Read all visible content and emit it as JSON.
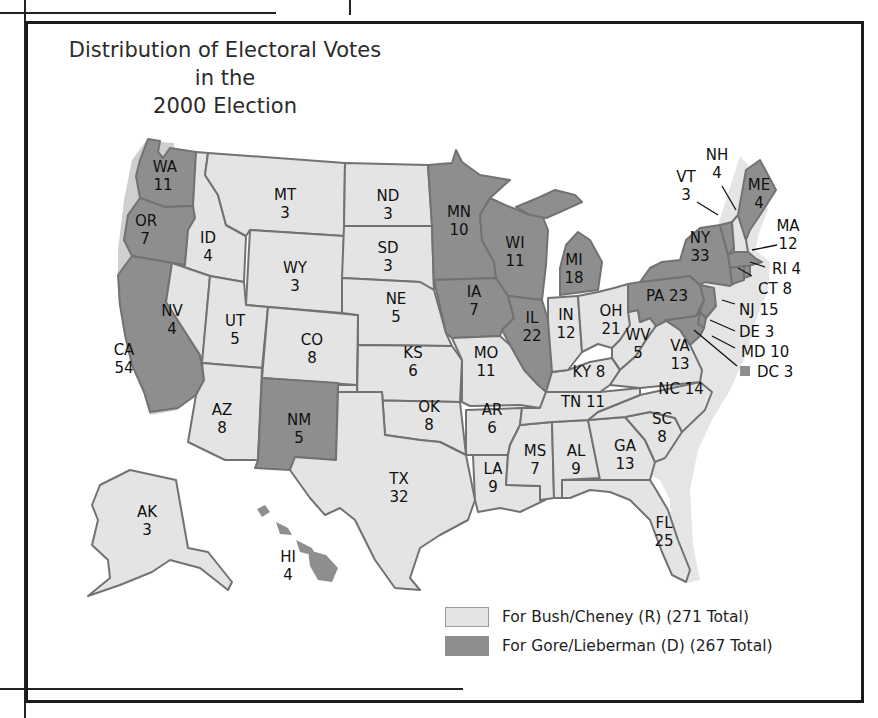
{
  "title": {
    "line1": "Distribution of Electoral Votes in the",
    "line2": "2000 Election"
  },
  "colors": {
    "bush_fill": "#e4e4e4",
    "gore_fill": "#8e8e8e",
    "border": "#727272",
    "frame": "#1b1b1b"
  },
  "legend": [
    {
      "party": "R",
      "label": "For Bush/Cheney (R) (271 Total)",
      "color": "#e4e4e4"
    },
    {
      "party": "D",
      "label": "For Gore/Lieberman (D) (267 Total)",
      "color": "#8e8e8e"
    }
  ],
  "states": {
    "WA": {
      "abbr": "WA",
      "votes": "11",
      "winner": "D"
    },
    "OR": {
      "abbr": "OR",
      "votes": "7",
      "winner": "D"
    },
    "CA": {
      "abbr": "CA",
      "votes": "54",
      "winner": "D"
    },
    "ID": {
      "abbr": "ID",
      "votes": "4",
      "winner": "R"
    },
    "NV": {
      "abbr": "NV",
      "votes": "4",
      "winner": "R"
    },
    "MT": {
      "abbr": "MT",
      "votes": "3",
      "winner": "R"
    },
    "WY": {
      "abbr": "WY",
      "votes": "3",
      "winner": "R"
    },
    "UT": {
      "abbr": "UT",
      "votes": "5",
      "winner": "R"
    },
    "CO": {
      "abbr": "CO",
      "votes": "8",
      "winner": "R"
    },
    "AZ": {
      "abbr": "AZ",
      "votes": "8",
      "winner": "R"
    },
    "NM": {
      "abbr": "NM",
      "votes": "5",
      "winner": "D"
    },
    "ND": {
      "abbr": "ND",
      "votes": "3",
      "winner": "R"
    },
    "SD": {
      "abbr": "SD",
      "votes": "3",
      "winner": "R"
    },
    "NE": {
      "abbr": "NE",
      "votes": "5",
      "winner": "R"
    },
    "KS": {
      "abbr": "KS",
      "votes": "6",
      "winner": "R"
    },
    "OK": {
      "abbr": "OK",
      "votes": "8",
      "winner": "R"
    },
    "TX": {
      "abbr": "TX",
      "votes": "32",
      "winner": "R"
    },
    "MN": {
      "abbr": "MN",
      "votes": "10",
      "winner": "D"
    },
    "IA": {
      "abbr": "IA",
      "votes": "7",
      "winner": "D"
    },
    "MO": {
      "abbr": "MO",
      "votes": "11",
      "winner": "R"
    },
    "AR": {
      "abbr": "AR",
      "votes": "6",
      "winner": "R"
    },
    "LA": {
      "abbr": "LA",
      "votes": "9",
      "winner": "R"
    },
    "WI": {
      "abbr": "WI",
      "votes": "11",
      "winner": "D"
    },
    "IL": {
      "abbr": "IL",
      "votes": "22",
      "winner": "D"
    },
    "MI": {
      "abbr": "MI",
      "votes": "18",
      "winner": "D"
    },
    "IN": {
      "abbr": "IN",
      "votes": "12",
      "winner": "R"
    },
    "OH": {
      "abbr": "OH",
      "votes": "21",
      "winner": "R"
    },
    "KY": {
      "abbr": "KY",
      "votes": "8",
      "winner": "R",
      "label": "KY 8"
    },
    "TN": {
      "abbr": "TN",
      "votes": "11",
      "winner": "R",
      "label": "TN 11"
    },
    "MS": {
      "abbr": "MS",
      "votes": "7",
      "winner": "R"
    },
    "AL": {
      "abbr": "AL",
      "votes": "9",
      "winner": "R"
    },
    "GA": {
      "abbr": "GA",
      "votes": "13",
      "winner": "R"
    },
    "FL": {
      "abbr": "FL",
      "votes": "25",
      "winner": "R"
    },
    "SC": {
      "abbr": "SC",
      "votes": "8",
      "winner": "R"
    },
    "NC": {
      "abbr": "NC",
      "votes": "14",
      "winner": "R",
      "label": "NC 14"
    },
    "VA": {
      "abbr": "VA",
      "votes": "13",
      "winner": "R"
    },
    "WV": {
      "abbr": "WV",
      "votes": "5",
      "winner": "R"
    },
    "PA": {
      "abbr": "PA",
      "votes": "23",
      "winner": "D",
      "label": "PA 23"
    },
    "NY": {
      "abbr": "NY",
      "votes": "33",
      "winner": "D"
    },
    "VT": {
      "abbr": "VT",
      "votes": "3",
      "winner": "D"
    },
    "NH": {
      "abbr": "NH",
      "votes": "4",
      "winner": "R"
    },
    "ME": {
      "abbr": "ME",
      "votes": "4",
      "winner": "D"
    },
    "MA": {
      "abbr": "MA",
      "votes": "12",
      "winner": "D"
    },
    "RI": {
      "abbr": "RI",
      "votes": "4",
      "winner": "D",
      "label": "RI 4"
    },
    "CT": {
      "abbr": "CT",
      "votes": "8",
      "winner": "D",
      "label": "CT 8"
    },
    "NJ": {
      "abbr": "NJ",
      "votes": "15",
      "winner": "D",
      "label": "NJ 15"
    },
    "DE": {
      "abbr": "DE",
      "votes": "3",
      "winner": "D",
      "label": "DE 3"
    },
    "MD": {
      "abbr": "MD",
      "votes": "10",
      "winner": "D",
      "label": "MD 10"
    },
    "DC": {
      "abbr": "DC",
      "votes": "3",
      "winner": "D",
      "label": "DC 3"
    },
    "AK": {
      "abbr": "AK",
      "votes": "3",
      "winner": "R"
    },
    "HI": {
      "abbr": "HI",
      "votes": "4",
      "winner": "D"
    }
  }
}
